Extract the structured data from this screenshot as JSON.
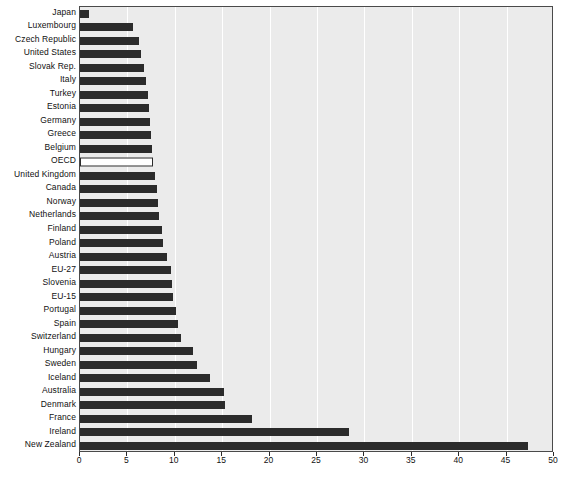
{
  "chart_data": {
    "type": "bar",
    "orientation": "horizontal",
    "title": "",
    "subtitle": "",
    "xlabel": "",
    "ylabel": "",
    "xlim": [
      0,
      50
    ],
    "ylim": null,
    "grid": true,
    "legend": null,
    "xticks": [
      0,
      5,
      10,
      15,
      20,
      25,
      30,
      35,
      40,
      45,
      50
    ],
    "xticklabels": [
      "0",
      "5",
      "10",
      "15",
      "20",
      "25",
      "30",
      "35",
      "40",
      "45",
      "50"
    ],
    "categories": [
      "Japan",
      "Luxembourg",
      "Czech Republic",
      "United States",
      "Slovak Rep.",
      "Italy",
      "Turkey",
      "Estonia",
      "Germany",
      "Greece",
      "Belgium",
      "OECD",
      "United Kingdom",
      "Canada",
      "Norway",
      "Netherlands",
      "Finland",
      "Poland",
      "Austria",
      "EU-27",
      "Slovenia",
      "EU-15",
      "Portugal",
      "Spain",
      "Switzerland",
      "Hungary",
      "Sweden",
      "Iceland",
      "Australia",
      "Denmark",
      "France",
      "Ireland",
      "New Zealand"
    ],
    "values": [
      0.9,
      5.6,
      6.2,
      6.4,
      6.8,
      7.0,
      7.2,
      7.3,
      7.4,
      7.5,
      7.6,
      7.7,
      7.9,
      8.1,
      8.2,
      8.3,
      8.6,
      8.8,
      9.2,
      9.6,
      9.7,
      9.8,
      10.1,
      10.3,
      10.7,
      11.9,
      12.3,
      13.7,
      15.2,
      15.3,
      18.1,
      28.4,
      47.3
    ],
    "highlight_category": "OECD",
    "colors": {
      "bar": "#2b2b2b",
      "highlight_bar": "#ffffff",
      "highlight_border": "#2b2b2b",
      "plot_background": "#ebebeb",
      "gridline": "#ffffff",
      "axis": "#4a4a4a",
      "text": "#111111"
    }
  }
}
